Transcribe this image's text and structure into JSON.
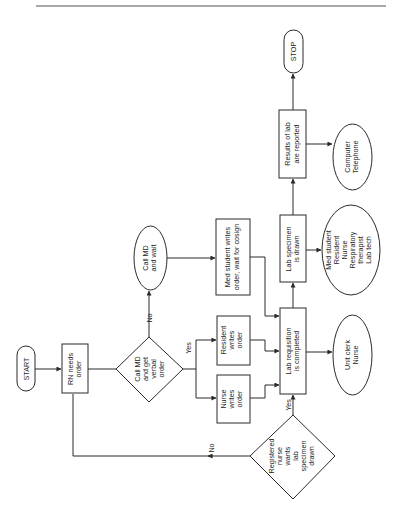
{
  "diagram": {
    "title": "",
    "orientation": "rotated-90-ccw",
    "nodes": {
      "start": {
        "label": "START",
        "shape": "terminal"
      },
      "rn_needs_order": {
        "label_lines": [
          "RN needs",
          "order"
        ],
        "shape": "process"
      },
      "call_md_verbal": {
        "label_lines": [
          "Call MD",
          "and get",
          "verbal",
          "order"
        ],
        "shape": "decision"
      },
      "call_md_wait": {
        "label_lines": [
          "Call MD",
          "and wait"
        ],
        "shape": "ellipse"
      },
      "med_student_writes": {
        "label_lines": [
          "Med student writes",
          "order, wait for cosign"
        ],
        "shape": "process"
      },
      "resident_writes": {
        "label_lines": [
          "Resident",
          "writes",
          "order"
        ],
        "shape": "process"
      },
      "nurse_writes": {
        "label_lines": [
          "Nurse",
          "writes",
          "order"
        ],
        "shape": "process"
      },
      "lab_requisition": {
        "label_lines": [
          "Lab requisition",
          "is completed"
        ],
        "shape": "process"
      },
      "lab_specimen": {
        "label_lines": [
          "Lab specimen",
          "is drawn"
        ],
        "shape": "process"
      },
      "results_reported": {
        "label_lines": [
          "Results of lab",
          "are reported"
        ],
        "shape": "process"
      },
      "stop": {
        "label": "STOP",
        "shape": "terminal"
      },
      "computer_telephone": {
        "label_lines": [
          "Computer",
          "Telephone"
        ],
        "shape": "ellipse"
      },
      "specimen_staff": {
        "label_lines": [
          "Med student",
          "Resident",
          "Nurse",
          "Respiratory",
          "therapist",
          "Lab tech"
        ],
        "shape": "ellipse"
      },
      "unit_clerk_nurse": {
        "label_lines": [
          "Unit clerk",
          "Nurse"
        ],
        "shape": "ellipse"
      },
      "rn_wants_specimen": {
        "label_lines": [
          "Registered",
          "nurse",
          "wants",
          "lab",
          "specimen",
          "drawn"
        ],
        "shape": "decision"
      }
    },
    "edge_labels": {
      "no_call_md": "No",
      "yes_call_md": "Yes",
      "yes_rn_wants": "Yes",
      "no_rn_wants": "No"
    }
  }
}
